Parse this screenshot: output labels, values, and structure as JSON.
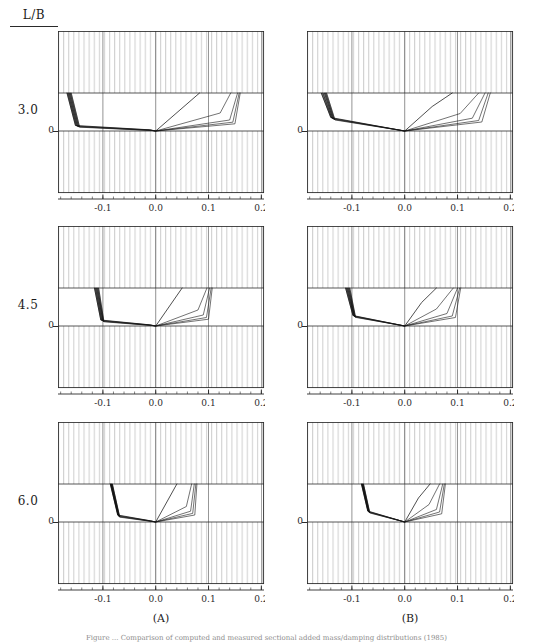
{
  "figure": {
    "row_header": "L/B",
    "column_captions": [
      "(A)",
      "(B)"
    ],
    "row_labels": [
      "3.0",
      "4.5",
      "6.0"
    ],
    "zero_label": "0",
    "caption": "Figure ... Comparison of computed and measured sectional added mass/damping distributions (1985)",
    "colors": {
      "axis": "#2b2b2b",
      "hatch": "#b9b9b9",
      "curve": "#141414",
      "background": "#ffffff"
    }
  },
  "chart_data": {
    "type": "line",
    "title": "L/B",
    "xlabel": "",
    "ylabel": "",
    "xlim": [
      -0.185,
      0.205
    ],
    "ylim": [
      -0.62,
      1.0
    ],
    "xticks": [
      -0.1,
      0.0,
      0.1,
      0.2
    ],
    "xticklabels": [
      "-0.1",
      "0.0",
      "0.1",
      "0.2"
    ],
    "yticks": [
      0.0
    ],
    "yticklabels": [
      "0"
    ],
    "grid": false,
    "legend_position": "none",
    "bands": {
      "description": "Vertically hatched regions above y=0.38 and below y=0.0; clear band between",
      "hatched_top": [
        0.38,
        1.0
      ],
      "clear_middle": [
        0.0,
        0.38
      ],
      "hatched_bottom": [
        -0.62,
        0.0
      ]
    },
    "panels": [
      {
        "id": "A-3.0",
        "row_label": "3.0",
        "column": "(A)",
        "series": [
          {
            "name": "curve-1",
            "x": [
              -0.168,
              -0.152,
              -0.012,
              0.0,
              0.083
            ],
            "y": [
              0.38,
              0.055,
              0.012,
              0.0,
              0.38
            ]
          },
          {
            "name": "curve-2",
            "x": [
              -0.166,
              -0.15,
              -0.01,
              0.0,
              0.122,
              0.142
            ],
            "y": [
              0.38,
              0.05,
              0.01,
              0.0,
              0.18,
              0.38
            ]
          },
          {
            "name": "curve-3",
            "x": [
              -0.164,
              -0.148,
              -0.01,
              0.0,
              0.14,
              0.155
            ],
            "y": [
              0.38,
              0.045,
              0.008,
              0.0,
              0.11,
              0.38
            ]
          },
          {
            "name": "curve-4",
            "x": [
              -0.162,
              -0.146,
              -0.008,
              0.0,
              0.146,
              0.158
            ],
            "y": [
              0.38,
              0.042,
              0.006,
              0.0,
              0.088,
              0.38
            ]
          },
          {
            "name": "curve-5",
            "x": [
              -0.16,
              -0.144,
              -0.008,
              0.0,
              0.15,
              0.16
            ],
            "y": [
              0.38,
              0.038,
              0.005,
              0.0,
              0.072,
              0.38
            ]
          }
        ]
      },
      {
        "id": "B-3.0",
        "row_label": "3.0",
        "column": "(B)",
        "series": [
          {
            "name": "curve-1",
            "x": [
              -0.158,
              -0.14,
              0.0,
              0.052,
              0.09
            ],
            "y": [
              0.38,
              0.135,
              0.0,
              0.245,
              0.38
            ]
          },
          {
            "name": "curve-2",
            "x": [
              -0.155,
              -0.138,
              0.0,
              0.105,
              0.14
            ],
            "y": [
              0.38,
              0.128,
              0.0,
              0.175,
              0.38
            ]
          },
          {
            "name": "curve-3",
            "x": [
              -0.152,
              -0.136,
              0.0,
              0.128,
              0.152
            ],
            "y": [
              0.38,
              0.122,
              0.0,
              0.128,
              0.38
            ]
          },
          {
            "name": "curve-4",
            "x": [
              -0.15,
              -0.134,
              0.0,
              0.14,
              0.158
            ],
            "y": [
              0.38,
              0.116,
              0.0,
              0.105,
              0.38
            ]
          },
          {
            "name": "curve-5",
            "x": [
              -0.148,
              -0.132,
              0.0,
              0.146,
              0.162
            ],
            "y": [
              0.38,
              0.11,
              0.0,
              0.09,
              0.38
            ]
          }
        ]
      },
      {
        "id": "A-4.5",
        "row_label": "4.5",
        "column": "(A)",
        "series": [
          {
            "name": "curve-1",
            "x": [
              -0.116,
              -0.104,
              -0.012,
              0.0,
              0.05
            ],
            "y": [
              0.38,
              0.06,
              0.012,
              0.0,
              0.38
            ]
          },
          {
            "name": "curve-2",
            "x": [
              -0.114,
              -0.102,
              -0.01,
              0.0,
              0.08,
              0.097
            ],
            "y": [
              0.38,
              0.055,
              0.01,
              0.0,
              0.16,
              0.38
            ]
          },
          {
            "name": "curve-3",
            "x": [
              -0.112,
              -0.1,
              -0.01,
              0.0,
              0.09,
              0.102
            ],
            "y": [
              0.38,
              0.05,
              0.008,
              0.0,
              0.11,
              0.38
            ]
          },
          {
            "name": "curve-4",
            "x": [
              -0.11,
              -0.099,
              -0.008,
              0.0,
              0.096,
              0.105
            ],
            "y": [
              0.38,
              0.046,
              0.006,
              0.0,
              0.085,
              0.38
            ]
          },
          {
            "name": "curve-5",
            "x": [
              -0.108,
              -0.098,
              -0.008,
              0.0,
              0.1,
              0.107
            ],
            "y": [
              0.38,
              0.042,
              0.005,
              0.0,
              0.068,
              0.38
            ]
          }
        ]
      },
      {
        "id": "B-4.5",
        "row_label": "4.5",
        "column": "(B)",
        "series": [
          {
            "name": "curve-1",
            "x": [
              -0.112,
              -0.098,
              0.0,
              0.032,
              0.06
            ],
            "y": [
              0.38,
              0.105,
              0.0,
              0.235,
              0.38
            ]
          },
          {
            "name": "curve-2",
            "x": [
              -0.11,
              -0.096,
              0.0,
              0.06,
              0.092
            ],
            "y": [
              0.38,
              0.1,
              0.0,
              0.17,
              0.38
            ]
          },
          {
            "name": "curve-3",
            "x": [
              -0.108,
              -0.095,
              0.0,
              0.08,
              0.1
            ],
            "y": [
              0.38,
              0.095,
              0.0,
              0.125,
              0.38
            ]
          },
          {
            "name": "curve-4",
            "x": [
              -0.106,
              -0.094,
              0.0,
              0.09,
              0.104
            ],
            "y": [
              0.38,
              0.09,
              0.0,
              0.1,
              0.38
            ]
          },
          {
            "name": "curve-5",
            "x": [
              -0.104,
              -0.093,
              0.0,
              0.096,
              0.106
            ],
            "y": [
              0.38,
              0.086,
              0.0,
              0.085,
              0.38
            ]
          }
        ]
      },
      {
        "id": "A-6.0",
        "row_label": "6.0",
        "column": "(A)",
        "series": [
          {
            "name": "curve-1",
            "x": [
              -0.086,
              -0.072,
              -0.01,
              0.0,
              0.04
            ],
            "y": [
              0.38,
              0.07,
              0.012,
              0.0,
              0.38
            ]
          },
          {
            "name": "curve-2",
            "x": [
              -0.085,
              -0.071,
              -0.009,
              0.0,
              0.058,
              0.068
            ],
            "y": [
              0.38,
              0.064,
              0.01,
              0.0,
              0.155,
              0.38
            ]
          },
          {
            "name": "curve-3",
            "x": [
              -0.084,
              -0.07,
              -0.008,
              0.0,
              0.066,
              0.073
            ],
            "y": [
              0.38,
              0.058,
              0.008,
              0.0,
              0.108,
              0.38
            ]
          },
          {
            "name": "curve-4",
            "x": [
              -0.083,
              -0.069,
              -0.007,
              0.0,
              0.07,
              0.076
            ],
            "y": [
              0.38,
              0.053,
              0.006,
              0.0,
              0.086,
              0.38
            ]
          },
          {
            "name": "curve-5",
            "x": [
              -0.082,
              -0.068,
              -0.007,
              0.0,
              0.074,
              0.078
            ],
            "y": [
              0.38,
              0.048,
              0.005,
              0.0,
              0.07,
              0.38
            ]
          }
        ]
      },
      {
        "id": "B-6.0",
        "row_label": "6.0",
        "column": "(B)",
        "series": [
          {
            "name": "curve-1",
            "x": [
              -0.082,
              -0.07,
              0.0,
              0.026,
              0.048
            ],
            "y": [
              0.38,
              0.11,
              0.0,
              0.24,
              0.38
            ]
          },
          {
            "name": "curve-2",
            "x": [
              -0.081,
              -0.069,
              0.0,
              0.046,
              0.066
            ],
            "y": [
              0.38,
              0.105,
              0.0,
              0.175,
              0.38
            ]
          },
          {
            "name": "curve-3",
            "x": [
              -0.08,
              -0.068,
              0.0,
              0.06,
              0.072
            ],
            "y": [
              0.38,
              0.1,
              0.0,
              0.125,
              0.38
            ]
          },
          {
            "name": "curve-4",
            "x": [
              -0.079,
              -0.067,
              0.0,
              0.066,
              0.075
            ],
            "y": [
              0.38,
              0.095,
              0.0,
              0.1,
              0.38
            ]
          },
          {
            "name": "curve-5",
            "x": [
              -0.078,
              -0.066,
              0.0,
              0.07,
              0.077
            ],
            "y": [
              0.38,
              0.09,
              0.0,
              0.082,
              0.38
            ]
          }
        ]
      }
    ]
  }
}
